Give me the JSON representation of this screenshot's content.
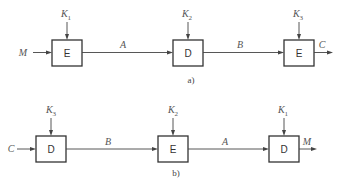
{
  "diagram_a": {
    "caption": "a)",
    "input_label": "M",
    "output_label": "C",
    "blocks": [
      {
        "label": "E",
        "key": "K",
        "key_sub": "1"
      },
      {
        "label": "D",
        "key": "K",
        "key_sub": "2"
      },
      {
        "label": "E",
        "key": "K",
        "key_sub": "3"
      }
    ],
    "edges": [
      "A",
      "B"
    ]
  },
  "diagram_b": {
    "caption": "b)",
    "input_label": "C",
    "output_label": "M",
    "blocks": [
      {
        "label": "D",
        "key": "K",
        "key_sub": "3"
      },
      {
        "label": "E",
        "key": "K",
        "key_sub": "2"
      },
      {
        "label": "D",
        "key": "K",
        "key_sub": "1"
      }
    ],
    "edges": [
      "B",
      "A"
    ]
  },
  "colors": {
    "stroke": "#333333",
    "text": "#555555",
    "background": "#ffffff"
  }
}
